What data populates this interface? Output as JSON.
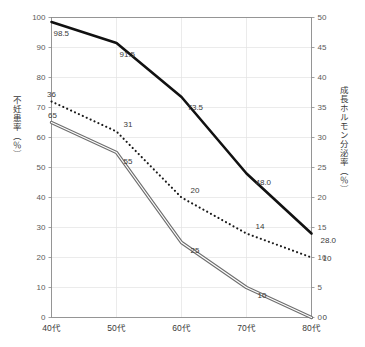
{
  "chart_data": {
    "type": "line",
    "title": "",
    "subtitle": "",
    "xlabel": "",
    "categories": [
      "40代",
      "50代",
      "60代",
      "70代",
      "80代"
    ],
    "grid": true,
    "legend": "none",
    "axes": {
      "left": {
        "label": "不妊患率（％）",
        "min": 0,
        "max": 100,
        "step": 10,
        "ticks": [
          "0",
          "10",
          "20",
          "30",
          "40",
          "50",
          "60",
          "70",
          "80",
          "90",
          "100"
        ]
      },
      "right": {
        "label": "成長ホルモン分泌率（％）",
        "min": 0,
        "max": 50,
        "step": 5,
        "ticks": [
          "0",
          "5",
          "10",
          "15",
          "20",
          "25",
          "30",
          "35",
          "40",
          "45",
          "50"
        ]
      }
    },
    "series": [
      {
        "name": "不妊患率",
        "axis": "left",
        "style": "solid-thick-black",
        "color": "#111111",
        "values": [
          98.5,
          91.5,
          73.5,
          48.0,
          28.0
        ],
        "labels": [
          "98.5",
          "91.5",
          "73.5",
          "48.0",
          "28.0"
        ]
      },
      {
        "name": "成長ホルモン分泌率",
        "axis": "right",
        "style": "dotted-black",
        "color": "#1a1a1a",
        "values": [
          36,
          31,
          20,
          14,
          10
        ],
        "labels": [
          "36",
          "31",
          "20",
          "14",
          "10"
        ]
      },
      {
        "name": "妊娠率",
        "axis": "left",
        "style": "double-line-gray",
        "color": "#6e6e6e",
        "values": [
          65,
          55,
          25,
          10,
          0
        ],
        "labels": [
          "65",
          "55",
          "25",
          "10",
          "0"
        ]
      }
    ]
  }
}
